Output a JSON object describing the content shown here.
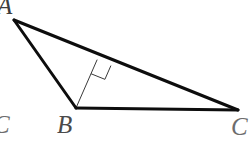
{
  "figure": {
    "kind": "geometry-diagram",
    "canvas": {
      "width": 252,
      "height": 152,
      "background_color": "#ffffff"
    },
    "style": {
      "side_stroke_color": "#0d0d0d",
      "side_stroke_width": 3,
      "altitude_stroke_color": "#3a3a3a",
      "altitude_stroke_width": 1,
      "right_angle_stroke_color": "#3a3a3a",
      "right_angle_stroke_width": 1,
      "label_color": "#4a4a4a"
    },
    "points": {
      "A": {
        "label": "A",
        "x": 14,
        "y": 20
      },
      "B": {
        "label": "B",
        "x": 76,
        "y": 108
      },
      "C": {
        "label": "C",
        "x": 238,
        "y": 110
      },
      "H": {
        "label": "",
        "x": 97,
        "y": 60
      }
    },
    "segments": [
      {
        "name": "side-AB",
        "from": "A",
        "to": "B",
        "kind": "triangle-side"
      },
      {
        "name": "side-BC",
        "from": "B",
        "to": "C",
        "kind": "triangle-side"
      },
      {
        "name": "side-AC",
        "from": "A",
        "to": "C",
        "kind": "triangle-side"
      },
      {
        "name": "altitude-BH",
        "from": "B",
        "to": "H",
        "kind": "altitude"
      }
    ],
    "markers": [
      {
        "name": "right-angle-at-H",
        "kind": "right-angle-square",
        "at": "H",
        "size": 15
      }
    ]
  },
  "labels": {
    "vertex_a": "A",
    "vertex_b": "B",
    "vertex_c_left": "C",
    "vertex_c_right": "C"
  }
}
